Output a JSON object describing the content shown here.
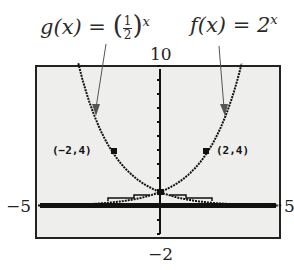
{
  "chart_data": {
    "type": "line",
    "title": "",
    "xlabel": "",
    "ylabel": "",
    "xlim": [
      -5,
      5
    ],
    "ylim": [
      -2,
      10
    ],
    "tick_labels": {
      "xmin": "−5",
      "xmax": "5",
      "ymax": "10",
      "ymin": "−2"
    },
    "grid": false,
    "series": [
      {
        "name": "g(x) = (1/2)^x",
        "formula": "(1/2)^x",
        "x": [
          -5,
          -4,
          -3,
          -2,
          -1,
          0,
          1,
          2,
          3,
          4,
          5
        ],
        "values": [
          32,
          16,
          8,
          4,
          2,
          1,
          0.5,
          0.25,
          0.125,
          0.0625,
          0.03125
        ]
      },
      {
        "name": "f(x) = 2^x",
        "formula": "2^x",
        "x": [
          -5,
          -4,
          -3,
          -2,
          -1,
          0,
          1,
          2,
          3,
          4,
          5
        ],
        "values": [
          0.03125,
          0.0625,
          0.125,
          0.25,
          0.5,
          1,
          2,
          4,
          8,
          16,
          32
        ]
      }
    ],
    "annotations": [
      {
        "text": "(-2,4)",
        "x": -2,
        "y": 4
      },
      {
        "text": "(2,4)",
        "x": 2,
        "y": 4
      }
    ]
  },
  "labels": {
    "g_name": "g(x) = ",
    "g_num": "1",
    "g_den": "2",
    "g_exp": "x",
    "f_name": "f(x) = 2",
    "f_exp": "x",
    "point_left": "(−2,4)",
    "point_right": "(2,4)"
  },
  "ticks": {
    "ymax": "10",
    "ymin": "−2",
    "xmin": "−5",
    "xmax": "5"
  }
}
